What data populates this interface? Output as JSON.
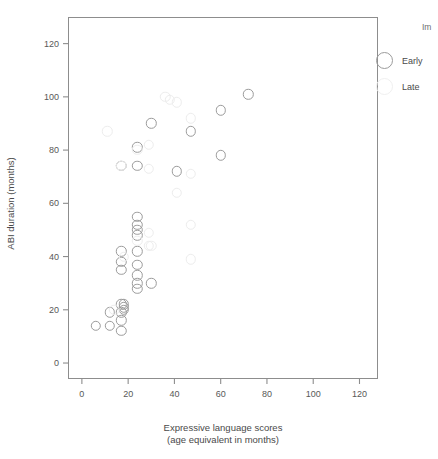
{
  "chart_data": {
    "type": "scatter",
    "title": "",
    "xlabel": "Expressive language scores",
    "xlabel_line2": "(age equivalent in months)",
    "ylabel": "ABI duration (months)",
    "xlim": [
      -6,
      128
    ],
    "ylim": [
      -6,
      130
    ],
    "xticks": [
      0,
      20,
      40,
      60,
      80,
      100,
      120
    ],
    "yticks": [
      0,
      20,
      40,
      60,
      80,
      100,
      120
    ],
    "grid": false,
    "legend_position": "right",
    "legend_title": "Implantation",
    "series": [
      {
        "name": "Early",
        "marker": "open-circle",
        "color": "#9b9b9b",
        "points": [
          [
            6,
            14
          ],
          [
            12,
            19
          ],
          [
            12,
            14
          ],
          [
            17,
            22
          ],
          [
            17,
            19
          ],
          [
            17,
            16
          ],
          [
            17,
            12
          ],
          [
            18,
            22
          ],
          [
            18,
            21
          ],
          [
            18,
            20
          ],
          [
            17,
            42
          ],
          [
            17,
            38
          ],
          [
            17,
            35
          ],
          [
            17,
            74
          ],
          [
            24,
            55
          ],
          [
            24,
            52
          ],
          [
            24,
            50
          ],
          [
            24,
            48
          ],
          [
            24,
            42
          ],
          [
            24,
            37
          ],
          [
            24,
            33
          ],
          [
            24,
            30
          ],
          [
            24,
            28
          ],
          [
            24,
            81
          ],
          [
            24,
            74
          ],
          [
            30,
            90
          ],
          [
            30,
            30
          ],
          [
            41,
            72
          ],
          [
            47,
            87
          ],
          [
            60,
            95
          ],
          [
            60,
            78
          ],
          [
            72,
            101
          ]
        ]
      },
      {
        "name": "Late",
        "marker": "open-circle",
        "color": "#ededed",
        "points": [
          [
            11,
            87
          ],
          [
            17,
            74
          ],
          [
            24,
            80
          ],
          [
            29,
            82
          ],
          [
            29,
            73
          ],
          [
            29,
            49
          ],
          [
            29,
            44
          ],
          [
            30,
            44
          ],
          [
            36,
            100
          ],
          [
            38,
            99
          ],
          [
            41,
            98
          ],
          [
            41,
            64
          ],
          [
            47,
            92
          ],
          [
            47,
            71
          ],
          [
            47,
            52
          ],
          [
            47,
            39
          ],
          [
            24,
            46
          ],
          [
            18,
            40
          ],
          [
            14,
            20
          ]
        ]
      }
    ]
  },
  "axes": {
    "y_tick_labels": [
      "0",
      "20",
      "40",
      "60",
      "80",
      "100",
      "120"
    ],
    "x_tick_labels": [
      "0",
      "20",
      "40",
      "60",
      "80",
      "100",
      "120"
    ],
    "y_title": "ABI duration (months)",
    "x_title_line1": "Expressive language scores",
    "x_title_line2": "(age equivalent in months)"
  },
  "legend": {
    "title": "Im",
    "items": [
      {
        "label": "Early",
        "color": "#9b9b9b"
      },
      {
        "label": "Late",
        "color": "#f0f0f0"
      }
    ]
  },
  "colors": {
    "frame": "#8d8d8d",
    "tick": "#8d8d8d",
    "text": "#4a4a4a",
    "early_marker": "#9b9b9b",
    "late_marker": "#ededed",
    "background": "#ffffff"
  }
}
